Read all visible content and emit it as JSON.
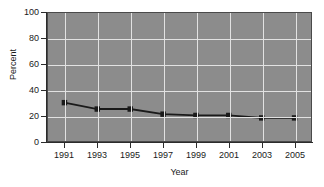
{
  "chart_data": {
    "type": "line",
    "title": "",
    "xlabel": "Year",
    "ylabel": "Percent",
    "x": [
      1991,
      1993,
      1995,
      1997,
      1999,
      2001,
      2003,
      2005
    ],
    "categories": [
      "1991",
      "1993",
      "1995",
      "1997",
      "1999",
      "2001",
      "2003",
      "2005"
    ],
    "values": [
      30,
      25,
      25,
      21,
      20,
      20,
      18,
      18
    ],
    "series": [
      {
        "name": "Percent",
        "values": [
          30,
          25,
          25,
          21,
          20,
          20,
          18,
          18
        ]
      }
    ],
    "xlim": [
      1990,
      2006
    ],
    "ylim": [
      0,
      100
    ],
    "ytick_labels": [
      "0",
      "20",
      "40",
      "60",
      "80",
      "100"
    ],
    "yticks": [
      0,
      20,
      40,
      60,
      80,
      100
    ],
    "xtick_labels": [
      "1991",
      "1993",
      "1995",
      "1997",
      "1999",
      "2001",
      "2003",
      "2005"
    ],
    "grid": "horizontal-and-vertical",
    "legend": "none",
    "colors": {
      "plot_background": "#8c8c8c",
      "gridline": "#e2e2e2",
      "line": "#1a1a1a",
      "marker": "#1a1a1a",
      "axis": "#2b2b2b",
      "text": "#1a1a1a",
      "figure_background": "#ffffff"
    }
  },
  "axis": {
    "y_title": "Percent",
    "x_title": "Year"
  }
}
